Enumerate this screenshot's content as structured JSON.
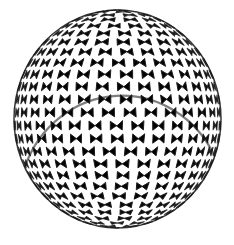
{
  "figure": {
    "alt_text": "Engraving of a hollow spherical colony covered in a honeycomb mesh of polygonal cells",
    "style": "monochrome line engraving with stipple shading",
    "background_color": "#ffffff",
    "canvas": {
      "width": 234,
      "height": 245
    }
  },
  "sphere": {
    "center_x": 117.5,
    "center_y": 119.0,
    "radius_x": 103.5,
    "radius_y": 109.0,
    "bounds": {
      "left": 14,
      "top": 10,
      "right": 221,
      "bottom": 228
    },
    "outline_color": "#141414",
    "outline_width": 1.5
  },
  "lighting": {
    "source_direction": "upper-left",
    "light_x": -0.55,
    "light_y": -0.62,
    "light_z": 0.56,
    "highlight_color": "#fdfdfd",
    "shadow_color": "#4a4a4a",
    "rim_shadow_strength": 0.72
  },
  "mesh": {
    "pattern": "honeycomb",
    "cell_shape": "hexagonal",
    "latitude_bands": 26,
    "cells_equator": 30,
    "center_cell_diameter_px": 14,
    "wall_color": "#1a1a1a",
    "wall_width_center": 0.95,
    "wall_width_limb": 0.55,
    "cell_fill_light": "#f2f2f2",
    "cell_fill_mid": "#d8d8d8",
    "cell_fill_dark": "#9a9a9a",
    "jitter": 0.17,
    "seed": 20240517
  },
  "stipple": {
    "enabled": true,
    "dots_per_cell_max": 7,
    "dot_radius_min": 0.18,
    "dot_radius_max": 0.46,
    "dot_color": "#5a5a5a",
    "opacity": 0.55
  }
}
